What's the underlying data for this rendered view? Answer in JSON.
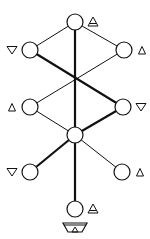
{
  "diagram": {
    "title": "",
    "colors": {
      "stroke": "#111111",
      "background": "#ffffff"
    },
    "nodes": [
      {
        "id": "n1",
        "x": 75,
        "y": 22,
        "r": 8,
        "marker": "triangle-up-double",
        "marker_side": "right"
      },
      {
        "id": "n2",
        "x": 30,
        "y": 50,
        "r": 8,
        "marker": "triangle-down",
        "marker_side": "left"
      },
      {
        "id": "n3",
        "x": 124,
        "y": 50,
        "r": 8,
        "marker": "triangle-up-small",
        "marker_side": "right"
      },
      {
        "id": "n4",
        "x": 30,
        "y": 107,
        "r": 8,
        "marker": "triangle-up-small",
        "marker_side": "left"
      },
      {
        "id": "n5",
        "x": 123,
        "y": 107,
        "r": 8,
        "marker": "triangle-down",
        "marker_side": "right"
      },
      {
        "id": "n6",
        "x": 75,
        "y": 135,
        "r": 8,
        "marker": "none",
        "marker_side": "none"
      },
      {
        "id": "n7",
        "x": 30,
        "y": 172,
        "r": 8,
        "marker": "triangle-down",
        "marker_side": "left"
      },
      {
        "id": "n8",
        "x": 122,
        "y": 172,
        "r": 8,
        "marker": "triangle-up-small",
        "marker_side": "right"
      },
      {
        "id": "n9",
        "x": 75,
        "y": 209,
        "r": 8,
        "marker": "triangle-up-double",
        "marker_side": "right"
      }
    ],
    "edges": [
      {
        "from": "n1",
        "to": "n2",
        "weight": "thin"
      },
      {
        "from": "n1",
        "to": "n3",
        "weight": "thin"
      },
      {
        "from": "n1",
        "to": "n6",
        "weight": "thick"
      },
      {
        "from": "n2",
        "to": "n5",
        "weight": "thick"
      },
      {
        "from": "n3",
        "to": "n4",
        "weight": "thin"
      },
      {
        "from": "n5",
        "to": "n6",
        "weight": "thick"
      },
      {
        "from": "n4",
        "to": "n6",
        "weight": "thin"
      },
      {
        "from": "n6",
        "to": "n7",
        "weight": "thick"
      },
      {
        "from": "n6",
        "to": "n8",
        "weight": "thin"
      },
      {
        "from": "n6",
        "to": "n9",
        "weight": "thick"
      }
    ],
    "base_symbol": {
      "x": 75,
      "y": 230,
      "type": "bowl-with-triangle"
    }
  }
}
